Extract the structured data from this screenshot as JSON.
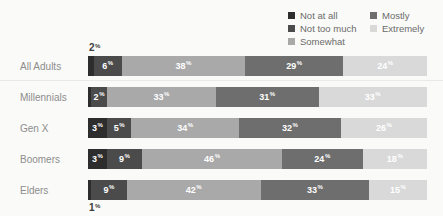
{
  "chart_data": {
    "type": "bar",
    "orientation": "horizontal",
    "stacked": true,
    "unit": "%",
    "legend_position": "top-right",
    "grid": false,
    "xlim": [
      0,
      100
    ],
    "categories": [
      "All Adults",
      "Millennials",
      "Gen X",
      "Boomers",
      "Elders"
    ],
    "series": [
      {
        "name": "Not at all",
        "color": "#2d2d2d",
        "values": [
          2,
          1,
          3,
          3,
          1
        ],
        "value_labels": [
          "",
          "",
          "3",
          "3",
          ""
        ]
      },
      {
        "name": "Not too much",
        "color": "#4b4b4b",
        "values": [
          6,
          2,
          5,
          9,
          9
        ],
        "value_labels": [
          "6",
          "2",
          "5",
          "9",
          "9"
        ]
      },
      {
        "name": "Somewhat",
        "color": "#a9a9a9",
        "values": [
          38,
          33,
          34,
          46,
          42
        ],
        "value_labels": [
          "38",
          "33",
          "34",
          "46",
          "42"
        ]
      },
      {
        "name": "Mostly",
        "color": "#6e6e6e",
        "values": [
          29,
          31,
          32,
          24,
          33
        ],
        "value_labels": [
          "29",
          "31",
          "32",
          "24",
          "33"
        ]
      },
      {
        "name": "Extremely",
        "color": "#d9d9d9",
        "values": [
          24,
          33,
          26,
          18,
          15
        ],
        "value_labels": [
          "24",
          "33",
          "26",
          "18",
          "15"
        ]
      }
    ],
    "annotations": [
      {
        "row": "All Adults",
        "series": "Not at all",
        "text": "2",
        "position": "above-bar-left"
      },
      {
        "row": "Elders",
        "series": "Not at all",
        "text": "1",
        "position": "below-bar-left"
      }
    ]
  }
}
